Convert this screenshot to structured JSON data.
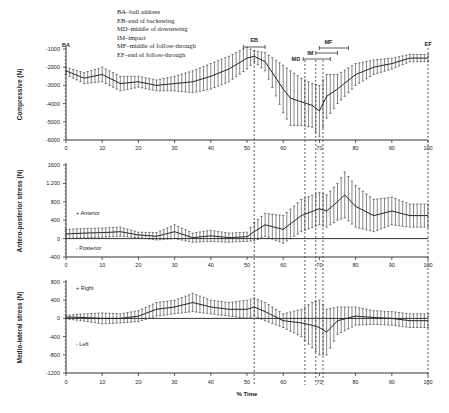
{
  "legend": [
    "BA–ball address",
    "EB–end of backswing",
    "MD–middle of downswing",
    "IM–impact",
    "MF–middle of follow-through",
    "EF–end of follow-through"
  ],
  "chart_data": [
    {
      "type": "line",
      "title": "",
      "xlabel": "% Time",
      "ylabel": "Compressive (N)",
      "ylim": [
        -6000,
        -1000
      ],
      "yticks": [
        "-1000",
        "-2000",
        "-3000",
        "-4000",
        "-5000",
        "-6000"
      ],
      "xticks": [
        "0",
        "10",
        "20",
        "30",
        "40",
        "50",
        "60",
        "70",
        "80",
        "90",
        "100"
      ],
      "x": [
        0,
        5,
        10,
        15,
        20,
        25,
        30,
        35,
        40,
        45,
        50,
        52,
        55,
        60,
        62,
        65,
        68,
        70,
        72,
        75,
        80,
        85,
        90,
        95,
        100
      ],
      "series": [
        {
          "name": "Compressive force",
          "values": [
            -2200,
            -2600,
            -2400,
            -2900,
            -2800,
            -3000,
            -2900,
            -2800,
            -2500,
            -2100,
            -1500,
            -1400,
            -1700,
            -3200,
            -3700,
            -3900,
            -4100,
            -4400,
            -3600,
            -3200,
            -2400,
            -2000,
            -1800,
            -1500,
            -1500
          ],
          "error": [
            200,
            300,
            400,
            400,
            300,
            300,
            400,
            600,
            700,
            700,
            600,
            300,
            500,
            1300,
            1500,
            1300,
            1200,
            1400,
            1200,
            800,
            600,
            400,
            300,
            200,
            200
          ]
        }
      ],
      "phase_markers": [
        {
          "label": "BA",
          "x": 0
        },
        {
          "label": "EB",
          "x": 52
        },
        {
          "label": "MD",
          "x": 66
        },
        {
          "label": "IM",
          "x": 69
        },
        {
          "label": "MF",
          "x": 71
        },
        {
          "label": "EF",
          "x": 100
        }
      ],
      "grid": false
    },
    {
      "type": "line",
      "ylabel": "Antero-posterior stress (N)",
      "ylim": [
        -400,
        1600
      ],
      "yticks": [
        "1600",
        "1,200",
        "800",
        "400",
        "0",
        "-400"
      ],
      "xticks": [
        "0",
        "10",
        "20",
        "30",
        "40",
        "50",
        "60",
        "70",
        "80",
        "90",
        "100"
      ],
      "annotations": [
        "+ Anterior",
        "- Posterior"
      ],
      "x": [
        0,
        5,
        10,
        15,
        20,
        25,
        30,
        35,
        40,
        45,
        50,
        52,
        55,
        60,
        65,
        70,
        72,
        75,
        77,
        80,
        85,
        90,
        95,
        100
      ],
      "series": [
        {
          "name": "Antero-posterior force",
          "values": [
            100,
            120,
            130,
            150,
            80,
            50,
            150,
            20,
            60,
            20,
            40,
            150,
            300,
            200,
            500,
            650,
            600,
            800,
            950,
            700,
            500,
            600,
            500,
            500
          ],
          "error": [
            100,
            100,
            100,
            100,
            60,
            80,
            150,
            100,
            120,
            100,
            100,
            200,
            250,
            300,
            350,
            350,
            350,
            400,
            500,
            450,
            350,
            300,
            250,
            250
          ]
        }
      ],
      "grid": false
    },
    {
      "type": "line",
      "xlabel": "% Time",
      "ylabel": "Medio-lateral stress (N)",
      "ylim": [
        -1200,
        800
      ],
      "yticks": [
        "800",
        "400",
        "0",
        "-400",
        "-800",
        "-1200"
      ],
      "xticks": [
        "0",
        "10",
        "20",
        "30",
        "40",
        "50",
        "60",
        "70",
        "80",
        "90",
        "100"
      ],
      "annotations": [
        "+ Right",
        "- Left"
      ],
      "x": [
        0,
        5,
        10,
        15,
        20,
        25,
        30,
        35,
        40,
        45,
        50,
        52,
        55,
        60,
        65,
        68,
        70,
        72,
        75,
        80,
        85,
        90,
        95,
        100
      ],
      "series": [
        {
          "name": "Medio-lateral force",
          "values": [
            30,
            20,
            0,
            0,
            50,
            200,
            250,
            350,
            250,
            200,
            200,
            250,
            150,
            -50,
            -100,
            -150,
            -200,
            -300,
            -50,
            50,
            20,
            0,
            -50,
            -50
          ],
          "error": [
            40,
            80,
            120,
            100,
            120,
            150,
            150,
            200,
            150,
            150,
            200,
            200,
            200,
            150,
            300,
            500,
            600,
            500,
            300,
            200,
            150,
            150,
            150,
            150
          ]
        }
      ],
      "grid": false
    }
  ]
}
